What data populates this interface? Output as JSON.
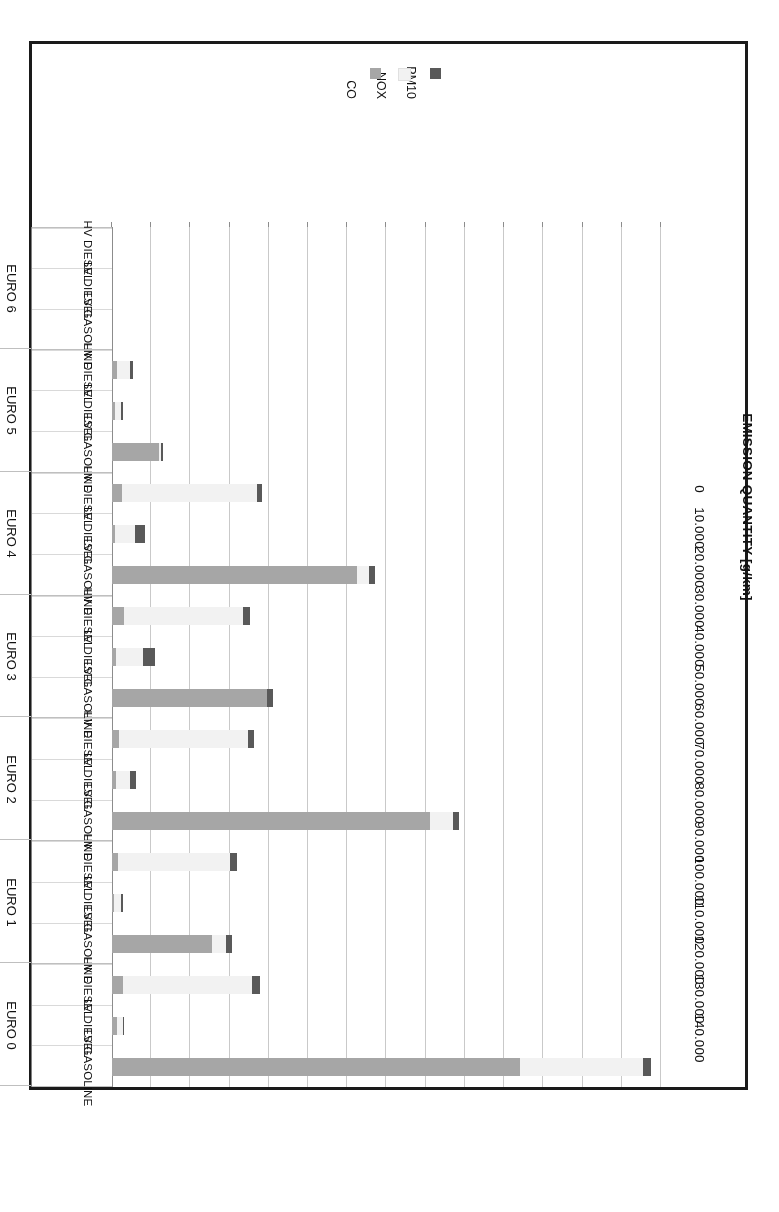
{
  "figure": {
    "value_axis_title": "EMISSION QUANTITY [g/km]",
    "legend_title": ""
  },
  "legend": {
    "items": [
      {
        "label": "PM10",
        "color": "#595959",
        "swatch_name": "legend-swatch-pm10"
      },
      {
        "label": "NOX",
        "color": "#f2f2f2",
        "swatch_name": "legend-swatch-nox"
      },
      {
        "label": "CO",
        "color": "#a6a6a6",
        "swatch_name": "legend-swatch-co"
      }
    ]
  },
  "axis": {
    "tick_labels": [
      "140.000",
      "130.000",
      "120.000",
      "110.000",
      "100.000",
      "90.000",
      "80.000",
      "70.000",
      "60.000",
      "50.000",
      "40.000",
      "30.000",
      "20.000",
      "10.000",
      "0"
    ],
    "tick_values": [
      140000,
      130000,
      120000,
      110000,
      100000,
      90000,
      80000,
      70000,
      60000,
      50000,
      40000,
      30000,
      20000,
      10000,
      0
    ],
    "max": 140000,
    "min": 0,
    "step": 10000
  },
  "chart_data": {
    "type": "bar",
    "orientation": "horizontal-stacked",
    "title": "",
    "subtitle": "",
    "xlabel": "EMISSION QUANTITY [g/km]",
    "ylabel": "",
    "xlim": [
      0,
      140000
    ],
    "grid": true,
    "legend_position": "bottom-center",
    "categories": [
      "EURO 0 / LV GASOLINE",
      "EURO 0 / LV DIESEL",
      "EURO 0 / HV DIESEL",
      "EURO 1 / LV GASOLINE",
      "EURO 1 / LV DIESEL",
      "EURO 1 / HV DIESEL",
      "EURO 2 / LV GASOLINE",
      "EURO 2 / LV DIESEL",
      "EURO 2 / HV DIESEL",
      "EURO 3 / LV GASOLINE",
      "EURO 3 / LV DIESEL",
      "EURO 3 / HV DIESEL",
      "EURO 4 / LV GASOLINE",
      "EURO 4 / LV DIESEL",
      "EURO 4 / HV DIESEL",
      "EURO 5 / LV GASOLINE",
      "EURO 5 / LV DIESEL",
      "EURO 5 / HV DIESEL",
      "EURO 6 / LV GASOLINE",
      "EURO 6 / LV DIESEL",
      "EURO 6 / HV DIESEL"
    ],
    "series": [
      {
        "name": "CO",
        "color": "#a6a6a6",
        "values": [
          104000,
          1200,
          2800,
          25500,
          600,
          1500,
          81000,
          1000,
          1800,
          39500,
          900,
          3000,
          62500,
          800,
          2500,
          12000,
          700,
          1200,
          0,
          0,
          0
        ]
      },
      {
        "name": "NOX",
        "color": "#f2f2f2",
        "values": [
          31500,
          1500,
          33000,
          3500,
          1800,
          28500,
          6000,
          3500,
          33000,
          0,
          7000,
          30500,
          3000,
          5000,
          34500,
          500,
          1500,
          3500,
          0,
          0,
          0
        ]
      },
      {
        "name": "PM10",
        "color": "#595959",
        "values": [
          2000,
          300,
          2000,
          1500,
          400,
          1800,
          1500,
          1500,
          1500,
          1500,
          3000,
          1700,
          1500,
          2500,
          1300,
          600,
          500,
          600,
          0,
          0,
          0
        ]
      }
    ],
    "groups": [
      {
        "label": "EURO 0",
        "rows": [
          "LV GASOLINE",
          "LV DIESEL",
          "HV DIESEL"
        ]
      },
      {
        "label": "EURO 1",
        "rows": [
          "LV GASOLINE",
          "LV DIESEL",
          "HV DIESEL"
        ]
      },
      {
        "label": "EURO 2",
        "rows": [
          "LV GASOLINE",
          "LV DIESEL",
          "HV DIESEL"
        ]
      },
      {
        "label": "EURO 3",
        "rows": [
          "LV GASOLINE",
          "LV DIESEL",
          "HV DIESEL"
        ]
      },
      {
        "label": "EURO 4",
        "rows": [
          "LV GASOLINE",
          "LV DIESEL",
          "HV DIESEL"
        ]
      },
      {
        "label": "EURO 5",
        "rows": [
          "LV GASOLINE",
          "LV DIESEL",
          "HV DIESEL"
        ]
      },
      {
        "label": "EURO 6",
        "rows": [
          "LV GASOLINE",
          "LV DIESEL",
          "HV DIESEL"
        ]
      }
    ]
  }
}
